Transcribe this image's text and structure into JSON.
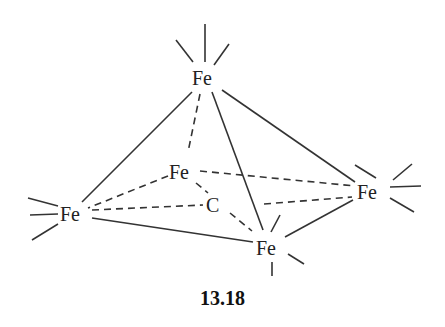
{
  "diagram": {
    "title": "13.18",
    "atoms": [
      {
        "id": "fe_top",
        "label": "Fe"
      },
      {
        "id": "fe_back",
        "label": "Fe"
      },
      {
        "id": "fe_left",
        "label": "Fe"
      },
      {
        "id": "fe_right",
        "label": "Fe"
      },
      {
        "id": "fe_bottom",
        "label": "Fe"
      },
      {
        "id": "c_center",
        "label": "C"
      }
    ],
    "bonds": {
      "solid": [
        [
          "fe_top",
          "fe_left"
        ],
        [
          "fe_top",
          "fe_right"
        ],
        [
          "fe_top",
          "fe_bottom"
        ],
        [
          "fe_left",
          "fe_bottom"
        ],
        [
          "fe_bottom",
          "fe_right"
        ]
      ],
      "dashed": [
        [
          "fe_top",
          "fe_back"
        ],
        [
          "fe_back",
          "fe_left"
        ],
        [
          "fe_back",
          "fe_right"
        ],
        [
          "fe_back",
          "c_center"
        ],
        [
          "fe_left",
          "c_center"
        ],
        [
          "c_center",
          "fe_right"
        ],
        [
          "c_center",
          "fe_bottom"
        ]
      ]
    },
    "colors": {
      "line": "#333333",
      "text": "#222222",
      "background": "#ffffff"
    }
  }
}
